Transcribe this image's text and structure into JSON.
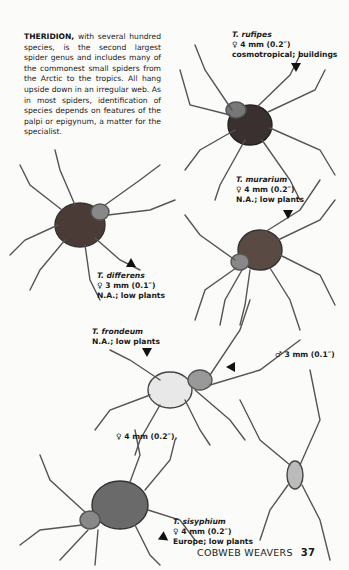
{
  "intro": {
    "lead": "THERIDION,",
    "text": " with several hundred species, is the second largest spider genus and includes many of the commonest small spiders from the Arctic to the tropics. All hang upside down in an irregular web. As in most spiders, identification of species depends on features of the palpi or epigynum, a matter for the specialist."
  },
  "species": [
    {
      "name": "T. rufipes",
      "size": "♀ 4 mm (0.2″)",
      "range": "cosmotropical; buildings"
    },
    {
      "name": "T. murarium",
      "size": "♀ 4 mm (0.2″)",
      "range": "N.A.; low plants"
    },
    {
      "name": "T. differens",
      "size": "♀ 3 mm (0.1″)",
      "range": "N.A.; low plants"
    },
    {
      "name": "T. frondeum",
      "range": "N.A.; low plants",
      "female_size": "♀ 4 mm (0.2″),",
      "male_size": "♂ 3 mm (0.1″)"
    },
    {
      "name": "T. sisyphium",
      "size": "♀ 4 mm (0.2″)",
      "range": "Europe; low plants"
    }
  ],
  "footer": {
    "section": "COBWEB WEAVERS",
    "page": "37"
  }
}
